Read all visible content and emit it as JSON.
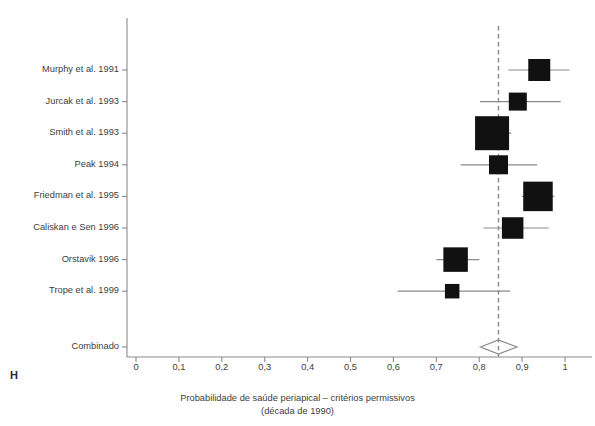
{
  "figure": {
    "panel_letter": "H",
    "caption_line1": "Probabilidade de saúde periapical – critérios permissivos",
    "caption_line2": "(década de 1990)",
    "summary_label": "Combinado",
    "colors": {
      "marker": "#111111",
      "axis": "#8a8a8a",
      "whisker": "#8a8a8a",
      "reference_line": "#8a8a8a",
      "text": "#404040",
      "background": "#ffffff"
    }
  },
  "chart_data": {
    "type": "scatter",
    "subtype": "forest-plot",
    "title": "Probabilidade de saúde periapical – critérios permissivos (década de 1990)",
    "xlabel": "Probabilidade de saúde periapical – critérios permissivos (década de 1990)",
    "ylabel": "",
    "xlim": [
      0,
      1
    ],
    "grid": false,
    "legend": "none",
    "x_ticks": [
      0,
      0.1,
      0.2,
      0.3,
      0.4,
      0.5,
      0.6,
      0.7,
      0.8,
      0.9,
      1
    ],
    "x_tick_labels": [
      "0",
      "0,1",
      "0,2",
      "0,3",
      "0,4",
      "0,5",
      "0,6",
      "0,7",
      "0,8",
      "0,9",
      "1"
    ],
    "reference_line": {
      "value": 0.845,
      "style": "dashed"
    },
    "studies": [
      {
        "label": "Murphy et al. 1991",
        "estimate": 0.94,
        "ci_low": 0.868,
        "ci_high": 1.01,
        "weight": 0.52
      },
      {
        "label": "Jurcak et al. 1993",
        "estimate": 0.89,
        "ci_low": 0.802,
        "ci_high": 0.99,
        "weight": 0.36
      },
      {
        "label": "Smith et al. 1993",
        "estimate": 0.83,
        "ci_low": 0.793,
        "ci_high": 0.875,
        "weight": 1.0
      },
      {
        "label": "Peak 1994",
        "estimate": 0.845,
        "ci_low": 0.757,
        "ci_high": 0.935,
        "weight": 0.4
      },
      {
        "label": "Friedman et al. 1995",
        "estimate": 0.937,
        "ci_low": 0.9,
        "ci_high": 0.975,
        "weight": 0.82
      },
      {
        "label": "Caliskan e Sen 1996",
        "estimate": 0.878,
        "ci_low": 0.81,
        "ci_high": 0.962,
        "weight": 0.5
      },
      {
        "label": "Orstavik 1996",
        "estimate": 0.745,
        "ci_low": 0.7,
        "ci_high": 0.8,
        "weight": 0.62
      },
      {
        "label": "Trope et al. 1999",
        "estimate": 0.737,
        "ci_low": 0.61,
        "ci_high": 0.872,
        "weight": 0.22
      }
    ],
    "summary": {
      "label": "Combinado",
      "estimate": 0.845,
      "ci_low": 0.803,
      "ci_high": 0.888,
      "shape": "diamond",
      "filled": false
    }
  }
}
